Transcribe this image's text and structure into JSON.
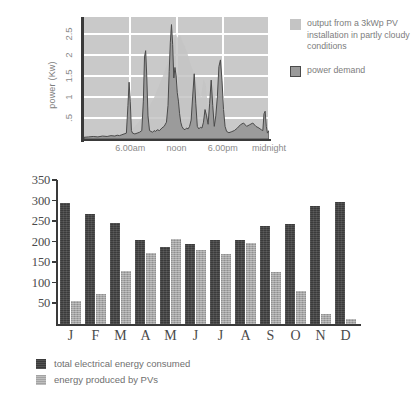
{
  "chart_data": [
    {
      "type": "area",
      "title": "",
      "xlabel": "",
      "ylabel": "power (Kw)",
      "ylim": [
        0,
        2.9
      ],
      "ytick_labels": [
        ".5",
        "1",
        "1.5",
        "2",
        "2.5"
      ],
      "ytick_values": [
        0.5,
        1.0,
        1.5,
        2.0,
        2.5
      ],
      "xtick_labels": [
        "6.00am",
        "noon",
        "6.00pm",
        "midnight"
      ],
      "xtick_values": [
        6,
        12,
        18,
        24
      ],
      "xlim": [
        0,
        24
      ],
      "grid": true,
      "legend_position": "right",
      "colors": {
        "plot_background": "#c9c9c9",
        "gridlines": "#ffffff",
        "pv_output": "#c4c4c4",
        "power_demand": "#9a9a9a",
        "demand_outline": "#4a4a4a",
        "axis": "#3a3a3a"
      },
      "series": [
        {
          "name": "output from a 3kWp PV installation in partly cloudy conditions",
          "key": "pv_output",
          "x": [
            0,
            4.6,
            5.2,
            5.9,
            6.6,
            7.3,
            8.0,
            8.5,
            9.0,
            9.4,
            9.8,
            10.2,
            10.6,
            11.0,
            11.3,
            11.6,
            11.9,
            12.2,
            12.5,
            12.8,
            13.1,
            13.4,
            13.7,
            14.0,
            14.3,
            14.6,
            14.9,
            15.2,
            15.5,
            15.8,
            16.1,
            16.4,
            16.7,
            17.0,
            17.3,
            17.6,
            18.0,
            18.4,
            19.0,
            24
          ],
          "y": [
            0,
            0,
            0.08,
            0.18,
            0.3,
            0.45,
            0.62,
            0.78,
            0.95,
            1.12,
            1.3,
            1.48,
            1.68,
            1.9,
            2.1,
            2.32,
            2.5,
            2.4,
            2.46,
            2.3,
            2.2,
            2.05,
            1.85,
            1.7,
            1.5,
            1.3,
            1.12,
            1.0,
            1.42,
            1.3,
            0.7,
            0.6,
            1.3,
            1.18,
            0.5,
            0.3,
            0.15,
            0.06,
            0,
            0
          ]
        },
        {
          "name": "power demand",
          "key": "power_demand",
          "x": [
            0,
            0.6,
            1.2,
            1.8,
            2.4,
            3.0,
            3.5,
            4.0,
            4.3,
            4.6,
            4.9,
            5.2,
            5.5,
            5.7,
            5.85,
            6.0,
            6.15,
            6.3,
            6.6,
            6.9,
            7.2,
            7.5,
            7.7,
            7.85,
            8.0,
            8.15,
            8.3,
            8.5,
            8.7,
            8.9,
            9.1,
            9.3,
            9.5,
            9.8,
            10.1,
            10.4,
            10.7,
            10.9,
            11.05,
            11.2,
            11.35,
            11.5,
            11.65,
            11.8,
            11.95,
            12.1,
            12.25,
            12.4,
            12.55,
            12.7,
            12.9,
            13.1,
            13.3,
            13.5,
            13.7,
            13.9,
            14.1,
            14.3,
            14.5,
            14.7,
            14.9,
            15.1,
            15.3,
            15.5,
            15.7,
            15.9,
            16.1,
            16.3,
            16.5,
            16.7,
            16.9,
            17.1,
            17.3,
            17.5,
            17.7,
            17.9,
            18.1,
            18.3,
            18.5,
            18.8,
            19.1,
            19.5,
            19.9,
            20.3,
            20.7,
            21.1,
            21.5,
            21.9,
            22.3,
            22.7,
            23.0,
            23.2,
            23.35,
            23.5,
            23.65,
            23.8,
            24.0
          ],
          "y": [
            0.04,
            0.05,
            0.06,
            0.05,
            0.07,
            0.06,
            0.08,
            0.07,
            0.09,
            0.08,
            0.1,
            0.12,
            0.14,
            0.8,
            1.35,
            0.9,
            0.2,
            0.14,
            0.12,
            0.14,
            0.16,
            0.2,
            0.9,
            1.95,
            2.1,
            1.45,
            0.55,
            0.2,
            0.18,
            0.16,
            0.2,
            0.18,
            0.22,
            0.2,
            0.26,
            0.3,
            0.4,
            0.8,
            1.6,
            2.3,
            2.72,
            2.25,
            1.45,
            1.7,
            1.5,
            1.1,
            0.9,
            0.6,
            0.4,
            0.3,
            0.24,
            0.22,
            0.26,
            0.24,
            0.3,
            0.45,
            1.02,
            1.55,
            0.85,
            0.3,
            0.24,
            0.28,
            0.26,
            0.4,
            0.7,
            0.55,
            0.35,
            0.85,
            1.4,
            0.8,
            0.3,
            0.55,
            1.0,
            1.72,
            1.88,
            1.4,
            0.7,
            0.3,
            0.18,
            0.15,
            0.17,
            0.2,
            0.26,
            0.34,
            0.38,
            0.3,
            0.34,
            0.38,
            0.3,
            0.26,
            0.22,
            0.2,
            0.6,
            0.66,
            0.3,
            0.14,
            0.2
          ]
        }
      ],
      "legend": [
        {
          "label": "output from a 3kWp PV installation in partly cloudy conditions",
          "swatch": "pv"
        },
        {
          "label": "power demand",
          "swatch": "demand"
        }
      ]
    },
    {
      "type": "bar",
      "title": "",
      "xlabel": "",
      "ylabel": "",
      "ylim": [
        0,
        350
      ],
      "categories": [
        "J",
        "F",
        "M",
        "A",
        "M",
        "J",
        "J",
        "A",
        "S",
        "O",
        "N",
        "D"
      ],
      "ytick_labels": [
        "50",
        "100",
        "150",
        "200",
        "250",
        "300",
        "350"
      ],
      "ytick_values": [
        50,
        100,
        150,
        200,
        250,
        300,
        350
      ],
      "grid": false,
      "legend_position": "bottom-left",
      "colors": {
        "consumed": "#3b3b3b",
        "produced": "#a3a3a3",
        "axis": "#3a3a3a"
      },
      "series": [
        {
          "name": "total electrical energy consumed",
          "key": "consumed",
          "values": [
            293,
            268,
            245,
            203,
            188,
            195,
            203,
            205,
            238,
            243,
            287,
            297
          ]
        },
        {
          "name": "energy produced by PVs",
          "key": "produced",
          "values": [
            55,
            72,
            128,
            173,
            206,
            180,
            171,
            196,
            127,
            80,
            25,
            11
          ]
        }
      ],
      "legend": [
        {
          "label": "total electrical energy consumed",
          "swatch": "consumed"
        },
        {
          "label": "energy produced by PVs",
          "swatch": "produced"
        }
      ]
    }
  ]
}
